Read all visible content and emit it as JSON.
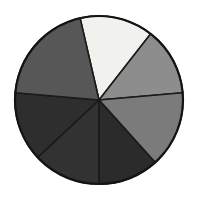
{
  "chart_data": {
    "type": "pie",
    "title": "",
    "subtitle": "",
    "xlabel": "",
    "ylabel": "",
    "grid": false,
    "legend_position": "none",
    "center_x": 99,
    "center_y": 100,
    "radius": 84,
    "start_angle_deg": -103,
    "direction": "clockwise",
    "background_color": "#ffffff",
    "outline_color": "#141414",
    "categories": [
      "Segment 1",
      "Segment 2",
      "Segment 3",
      "Segment 4",
      "Segment 5",
      "Segment 6",
      "Segment 7"
    ],
    "values": [
      14.2,
      14.2,
      14.2,
      14.2,
      14.2,
      14.2,
      14.8
    ],
    "slices": [
      {
        "label": "Segment 1",
        "value": 14.2,
        "start_deg": -103,
        "end_deg": -52,
        "color": "#f1f1ee",
        "position": "top"
      },
      {
        "label": "Segment 2",
        "value": 14.2,
        "start_deg": -52,
        "end_deg": -5,
        "color": "#8d8d8d",
        "position": "upper-right"
      },
      {
        "label": "Segment 3",
        "value": 14.2,
        "start_deg": -5,
        "end_deg": 48,
        "color": "#7b7b7b",
        "position": "right"
      },
      {
        "label": "Segment 4",
        "value": 14.2,
        "start_deg": 48,
        "end_deg": 90,
        "color": "#2b2b2b",
        "position": "lower-right"
      },
      {
        "label": "Segment 5",
        "value": 14.2,
        "start_deg": 90,
        "end_deg": 137,
        "color": "#323232",
        "position": "bottom"
      },
      {
        "label": "Segment 6",
        "value": 14.2,
        "start_deg": 137,
        "end_deg": 185,
        "color": "#2e2e2e",
        "position": "lower-left"
      },
      {
        "label": "Segment 7",
        "value": 14.8,
        "start_deg": 185,
        "end_deg": 257,
        "color": "#575757",
        "position": "upper-left"
      }
    ]
  }
}
